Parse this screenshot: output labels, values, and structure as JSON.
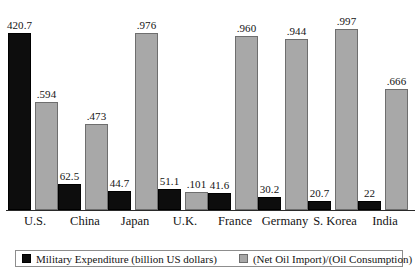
{
  "chart_data": {
    "type": "bar",
    "title": "",
    "subtitle": "",
    "xlabel": "",
    "ylabel": "",
    "grid": false,
    "legend_position": "bottom",
    "categories": [
      "U.S.",
      "China",
      "Japan",
      "U.K.",
      "France",
      "Germany",
      "S. Korea",
      "India"
    ],
    "series": [
      {
        "name": "Military Expenditure (billion US dollars)",
        "color": "#0d0d0d",
        "axis": "left",
        "ylim": [
          0,
          440
        ],
        "values": [
          420.7,
          62.5,
          44.7,
          51.1,
          41.6,
          30.2,
          20.7,
          22
        ],
        "labels": [
          "420.7",
          "62.5",
          "44.7",
          "51.1",
          "41.6",
          "30.2",
          "20.7",
          "22"
        ]
      },
      {
        "name": "(Net Oil Import)/(Oil Consumption)",
        "color": "#a8a8a8",
        "axis": "right",
        "ylim": [
          0,
          1.02
        ],
        "values": [
          0.594,
          0.473,
          0.976,
          0.101,
          0.96,
          0.944,
          0.997,
          0.666
        ],
        "labels": [
          ".594",
          ".473",
          ".976",
          ".101",
          ".960",
          ".944",
          ".997",
          ".666"
        ]
      }
    ]
  },
  "legend": {
    "entries": [
      {
        "label": "Military Expenditure (billion US dollars)",
        "swatch": "black-square-swatch"
      },
      {
        "label": "(Net Oil Import)/(Oil Consumption)",
        "swatch": "gray-square-swatch"
      }
    ]
  }
}
